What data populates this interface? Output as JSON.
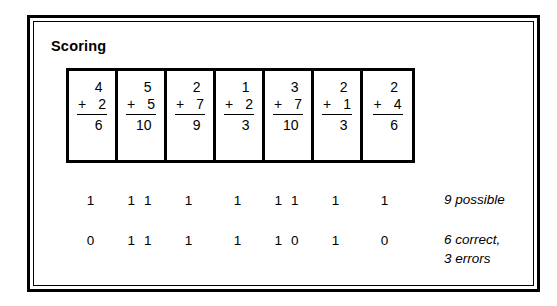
{
  "panel": {
    "title": "Scoring"
  },
  "problems": [
    {
      "top": "4",
      "plus": "+",
      "bottom": "2",
      "sum": "6"
    },
    {
      "top": "5",
      "plus": "+",
      "bottom": "5",
      "sum": "10"
    },
    {
      "top": "2",
      "plus": "+",
      "bottom": "7",
      "sum": "9"
    },
    {
      "top": "1",
      "plus": "+",
      "bottom": "2",
      "sum": "3"
    },
    {
      "top": "3",
      "plus": "+",
      "bottom": "7",
      "sum": "10"
    },
    {
      "top": "2",
      "plus": "+",
      "bottom": "1",
      "sum": "3"
    },
    {
      "top": "2",
      "plus": "+",
      "bottom": "4",
      "sum": "6"
    }
  ],
  "score_rows": [
    {
      "name": "possible",
      "cells": [
        [
          "1"
        ],
        [
          "1",
          "1"
        ],
        [
          "1"
        ],
        [
          "1"
        ],
        [
          "1",
          "1"
        ],
        [
          "1"
        ],
        [
          "1"
        ]
      ],
      "note": "9 possible"
    },
    {
      "name": "correct",
      "cells": [
        [
          "0"
        ],
        [
          "1",
          "1"
        ],
        [
          "1"
        ],
        [
          "1"
        ],
        [
          "1",
          "0"
        ],
        [
          "1"
        ],
        [
          "0"
        ]
      ],
      "note": "6 correct,\n3 errors"
    }
  ],
  "chart_data": {
    "type": "table",
    "title": "Scoring",
    "columns": [
      "Problem 1",
      "Problem 2",
      "Problem 3",
      "Problem 4",
      "Problem 5",
      "Problem 6",
      "Problem 7"
    ],
    "problems": [
      "4 + 2 = 6",
      "5 + 5 = 10",
      "2 + 7 = 9",
      "1 + 2 = 3",
      "3 + 7 = 10",
      "2 + 1 = 3",
      "2 + 4 = 6"
    ],
    "rows": [
      {
        "label": "9 possible",
        "values": [
          [
            1
          ],
          [
            1,
            1
          ],
          [
            1
          ],
          [
            1
          ],
          [
            1,
            1
          ],
          [
            1
          ],
          [
            1
          ]
        ],
        "total": 9
      },
      {
        "label": "6 correct, 3 errors",
        "values": [
          [
            0
          ],
          [
            1,
            1
          ],
          [
            1
          ],
          [
            1
          ],
          [
            1,
            0
          ],
          [
            1
          ],
          [
            0
          ]
        ],
        "total": 6
      }
    ],
    "possible_points": 9,
    "correct_points": 6,
    "errors": 3
  },
  "colors": {
    "ink": "#000000",
    "paper": "#ffffff"
  }
}
